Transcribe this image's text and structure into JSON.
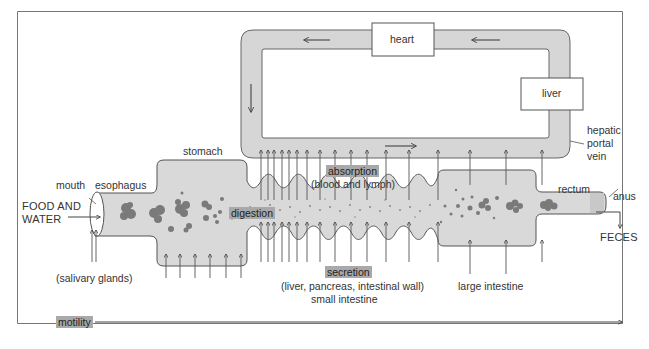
{
  "diagram": {
    "circulation": {
      "heart_label": "heart",
      "liver_label": "liver",
      "vein_label_lines": [
        "hepatic",
        "portal",
        "vein"
      ]
    },
    "tract": {
      "mouth_label": "mouth",
      "esophagus_label": "esophagus",
      "stomach_label": "stomach",
      "small_intestine_label": "small intestine",
      "large_intestine_label": "large intestine",
      "rectum_label": "rectum",
      "anus_label": "anus"
    },
    "input_label_lines": [
      "FOOD AND",
      "WATER"
    ],
    "output_label": "FECES",
    "processes": {
      "absorption": "absorption",
      "absorption_detail": "(blood and lymph)",
      "digestion": "digestion",
      "secretion": "secretion",
      "secretion_detail": "(liver, pancreas, intestinal wall)",
      "salivary": "(salivary glands)",
      "motility": "motility"
    },
    "colors": {
      "vessel_fill": "#d6d6d6",
      "tract_fill": "#d9d9d9",
      "outline": "#555555",
      "food_particles": "#7a7a7a",
      "highlight": "#a9a9a9"
    }
  }
}
